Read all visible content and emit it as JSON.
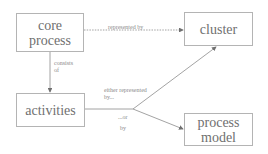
{
  "nodes": {
    "core_process": {
      "label": "core process"
    },
    "cluster": {
      "label": "cluster"
    },
    "activities": {
      "label": "activities"
    },
    "process_model": {
      "label_line1": "process",
      "label_line2": "model"
    }
  },
  "edges": {
    "core_to_cluster": {
      "label": "represented by"
    },
    "core_to_activities": {
      "label_line1": "consists",
      "label_line2": "of"
    },
    "activities_to_cluster": {
      "label_line1": "either represented",
      "label_line2": "by..."
    },
    "activities_to_model": {
      "label_line1": "...or",
      "label_line2": "by"
    }
  },
  "colors": {
    "line": "#8c8c8c",
    "box_border": "#b4b4b4",
    "text": "#707070"
  }
}
